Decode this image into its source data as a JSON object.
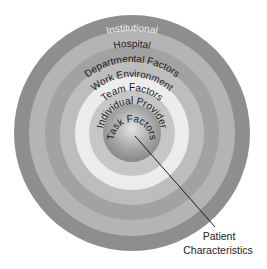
{
  "diagram": {
    "type": "concentric-circles",
    "center": {
      "x": 132,
      "y": 133
    },
    "rings": [
      {
        "label": "Institutional",
        "outer_radius": 118,
        "color": "#8e8e8e",
        "text_color": "#f0f0f0"
      },
      {
        "label": "Hospital",
        "outer_radius": 103,
        "color": "#b4b4b4",
        "text_color": "#1a1a1a"
      },
      {
        "label": "Departmental Factors",
        "outer_radius": 87,
        "color": "#a2a2a2",
        "text_color": "#1a1a1a"
      },
      {
        "label": "Work Environment",
        "outer_radius": 72,
        "color": "#bdbdbd",
        "text_color": "#1a1a1a"
      },
      {
        "label": "Team Factors",
        "outer_radius": 57,
        "color": "#ececec",
        "text_color": "#1a1a1a"
      },
      {
        "label": "Individual Provider",
        "outer_radius": 43,
        "color": "#c6c6c6",
        "text_color": "#1a1a1a"
      },
      {
        "label": "Task Factors",
        "outer_radius": 29,
        "color": "#9a9a9a",
        "text_color": "#1a1a1a"
      }
    ],
    "callout": {
      "line_from": {
        "x": 135,
        "y": 136
      },
      "line_to": {
        "x": 215,
        "y": 227
      },
      "label_line1": "Patient",
      "label_line2": "Characteristics"
    }
  }
}
